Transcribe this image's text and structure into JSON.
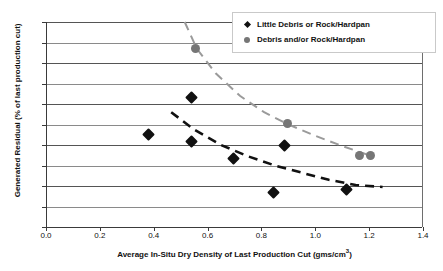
{
  "chart_data": {
    "type": "scatter",
    "title": "",
    "xlabel": "Average In-Situ Dry Density of Last Production Cut (gms/cm",
    "xlabel_sup": "3",
    "xlabel_tail": ")",
    "ylabel": "Generated Residual (% of last production cut)",
    "xlim": [
      0.0,
      1.4
    ],
    "ylim": [
      0,
      10
    ],
    "grid": true,
    "legend_position": "top-right",
    "xticks": [
      "0.0",
      "0.2",
      "0.4",
      "0.6",
      "0.8",
      "1.0",
      "1.2",
      "1.4"
    ],
    "xtick_values": [
      0.0,
      0.2,
      0.4,
      0.6,
      0.8,
      1.0,
      1.2,
      1.4
    ],
    "yticks": [
      "0%",
      "1%",
      "2%",
      "3%",
      "4%",
      "5%",
      "6%",
      "7%",
      "8%",
      "9%",
      "10%"
    ],
    "ytick_values": [
      0,
      1,
      2,
      3,
      4,
      5,
      6,
      7,
      8,
      9,
      10
    ],
    "series": [
      {
        "name": "Little Debris or Rock/Hardpan",
        "marker": "diamond",
        "color": "#111111",
        "points": [
          {
            "x": 0.38,
            "y": 4.5
          },
          {
            "x": 0.54,
            "y": 6.3
          },
          {
            "x": 0.54,
            "y": 4.15
          },
          {
            "x": 0.695,
            "y": 3.35
          },
          {
            "x": 0.845,
            "y": 1.7
          },
          {
            "x": 0.885,
            "y": 4.0
          },
          {
            "x": 1.115,
            "y": 1.85
          }
        ],
        "trend": {
          "color": "#111111",
          "dash": "9 6",
          "width": 2.6,
          "points": [
            {
              "x": 0.465,
              "y": 5.6
            },
            {
              "x": 0.55,
              "y": 4.75
            },
            {
              "x": 0.65,
              "y": 4.0
            },
            {
              "x": 0.75,
              "y": 3.45
            },
            {
              "x": 0.85,
              "y": 3.0
            },
            {
              "x": 0.95,
              "y": 2.65
            },
            {
              "x": 1.05,
              "y": 2.3
            },
            {
              "x": 1.15,
              "y": 2.05
            },
            {
              "x": 1.25,
              "y": 1.95
            }
          ]
        }
      },
      {
        "name": "Debris and/or Rock/Hardpan",
        "marker": "circle",
        "color": "#767676",
        "points": [
          {
            "x": 0.555,
            "y": 8.7
          },
          {
            "x": 0.895,
            "y": 5.05
          },
          {
            "x": 1.165,
            "y": 3.5
          },
          {
            "x": 1.205,
            "y": 3.5
          }
        ],
        "trend": {
          "color": "#9a9a9a",
          "dash": "9 6",
          "width": 2.0,
          "points": [
            {
              "x": 0.515,
              "y": 10.0
            },
            {
              "x": 0.56,
              "y": 8.7
            },
            {
              "x": 0.63,
              "y": 7.5
            },
            {
              "x": 0.72,
              "y": 6.4
            },
            {
              "x": 0.81,
              "y": 5.6
            },
            {
              "x": 0.9,
              "y": 5.0
            },
            {
              "x": 1.0,
              "y": 4.45
            },
            {
              "x": 1.1,
              "y": 3.95
            },
            {
              "x": 1.2,
              "y": 3.5
            }
          ]
        }
      }
    ]
  },
  "legend": {
    "items": [
      {
        "label": "Little Debris or Rock/Hardpan",
        "marker": "diamond"
      },
      {
        "label": "Debris and/or Rock/Hardpan",
        "marker": "circle"
      }
    ]
  }
}
